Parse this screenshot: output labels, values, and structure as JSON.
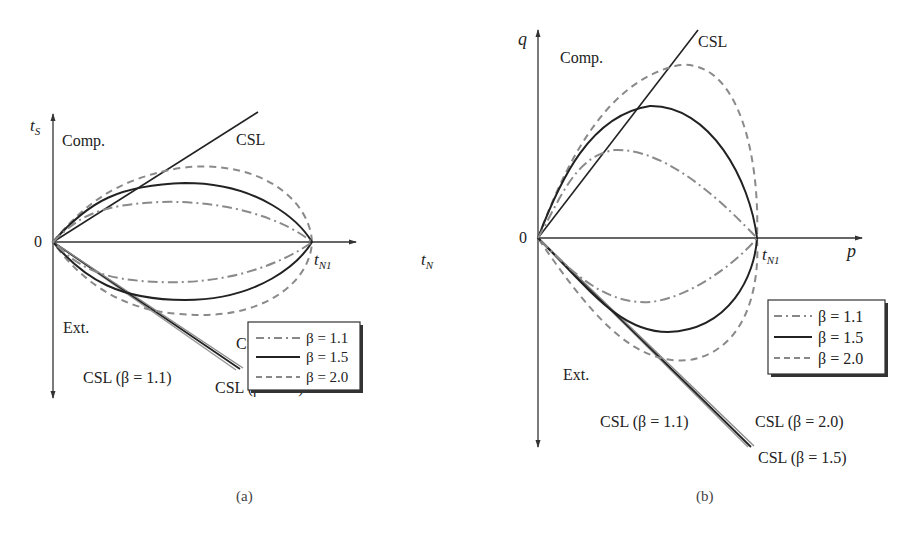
{
  "figure": {
    "panels": [
      {
        "id": "a",
        "caption": "(a)",
        "y_axis_label_main": "t",
        "y_axis_label_sub": "S",
        "x_axis_label_main": "t",
        "x_axis_label_sub": "N",
        "origin_label": "0",
        "intercept_label_main": "t",
        "intercept_label_sub": "N1",
        "region_top": "Comp.",
        "region_bottom": "Ext.",
        "csl_top": "CSL",
        "csl_labels": [
          "CSL (β = 1.1)",
          "CSL (β = 2.0)",
          "CSL (β = 1.5)"
        ],
        "legend": [
          {
            "label": "β = 1.1",
            "style": "dash-dot",
            "color": "#888888"
          },
          {
            "label": "β = 1.5",
            "style": "solid",
            "color": "#222222"
          },
          {
            "label": "β = 2.0",
            "style": "dashed",
            "color": "#888888"
          }
        ]
      },
      {
        "id": "b",
        "caption": "(b)",
        "y_axis_label_main": "q",
        "x_axis_label_main": "p",
        "origin_label": "0",
        "intercept_label_main": "t",
        "intercept_label_sub": "N1",
        "region_top": "Comp.",
        "region_bottom": "Ext.",
        "csl_top": "CSL",
        "csl_labels": [
          "CSL (β = 1.1)",
          "CSL (β = 2.0)",
          "CSL (β = 1.5)"
        ],
        "legend": [
          {
            "label": "β = 1.1",
            "style": "dash-dot",
            "color": "#888888"
          },
          {
            "label": "β = 1.5",
            "style": "solid",
            "color": "#222222"
          },
          {
            "label": "β = 2.0",
            "style": "dashed",
            "color": "#888888"
          }
        ]
      }
    ]
  },
  "colors": {
    "axis": "#333333",
    "solid_curve": "#222222",
    "gray_curve": "#8a8a8a",
    "text": "#222222"
  }
}
